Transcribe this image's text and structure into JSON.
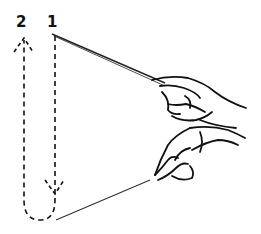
{
  "diagram": {
    "type": "conducting-pattern",
    "beats": [
      {
        "label": "1",
        "direction": "down",
        "x": 55
      },
      {
        "label": "2",
        "direction": "up",
        "x": 24
      }
    ],
    "colors": {
      "ink": "#111111",
      "background": "#ffffff"
    }
  }
}
